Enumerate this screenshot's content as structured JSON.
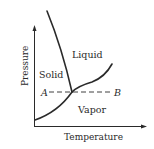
{
  "diagram": {
    "type": "phase-diagram",
    "axes": {
      "x_label": "Temperature",
      "y_label": "Pressure"
    },
    "regions": {
      "solid": "Solid",
      "liquid": "Liquid",
      "vapor": "Vapor"
    },
    "points": {
      "a": "A",
      "b": "B"
    },
    "colors": {
      "line": "#2a2a2a",
      "background": "#ffffff"
    }
  }
}
